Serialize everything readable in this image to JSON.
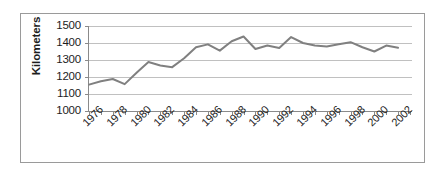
{
  "chart_data": {
    "type": "line",
    "title": "",
    "xlabel": "",
    "ylabel": "Kilometers",
    "ylim": [
      1000,
      1500
    ],
    "ytick_labels": [
      "1500",
      "1400",
      "1300",
      "1200",
      "1100",
      "1000"
    ],
    "yticks": [
      1500,
      1400,
      1300,
      1200,
      1100,
      1000
    ],
    "xlim": [
      1976,
      2003
    ],
    "xtick_labels": [
      "1976",
      "1978",
      "1980",
      "1982",
      "1984",
      "1986",
      "1988",
      "1990",
      "1992",
      "1994",
      "1996",
      "1998",
      "2000",
      "2002"
    ],
    "xticks": [
      1976,
      1978,
      1980,
      1982,
      1984,
      1986,
      1988,
      1990,
      1992,
      1994,
      1996,
      1998,
      2000,
      2002
    ],
    "grid": "horizontal",
    "legend": "none",
    "line_color": "#808080",
    "grid_color": "#c0c0c0",
    "axis_color": "#808080",
    "x": [
      1976,
      1977,
      1978,
      1979,
      1980,
      1981,
      1982,
      1983,
      1984,
      1985,
      1986,
      1987,
      1988,
      1989,
      1990,
      1991,
      1992,
      1993,
      1994,
      1995,
      1996,
      1997,
      1998,
      1999,
      2000,
      2001,
      2002
    ],
    "values": [
      1155,
      1175,
      1188,
      1158,
      1225,
      1288,
      1268,
      1258,
      1310,
      1375,
      1392,
      1355,
      1410,
      1438,
      1365,
      1385,
      1370,
      1435,
      1400,
      1385,
      1380,
      1392,
      1405,
      1375,
      1350,
      1385,
      1372
    ],
    "series": [
      {
        "name": "Kilometers",
        "values": [
          1155,
          1175,
          1188,
          1158,
          1225,
          1288,
          1268,
          1258,
          1310,
          1375,
          1392,
          1355,
          1410,
          1438,
          1365,
          1385,
          1370,
          1435,
          1400,
          1385,
          1380,
          1392,
          1405,
          1375,
          1350,
          1385,
          1372
        ]
      }
    ]
  }
}
